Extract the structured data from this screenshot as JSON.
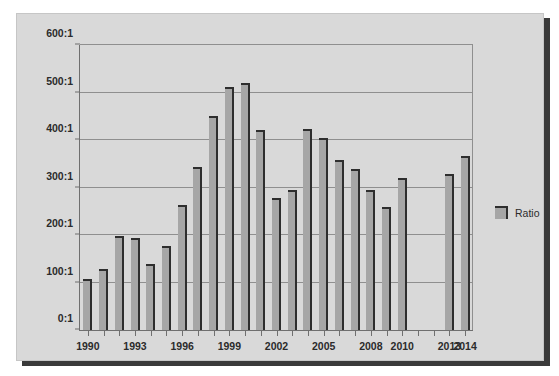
{
  "chart_data": {
    "type": "bar",
    "title": "",
    "xlabel": "",
    "ylabel": "",
    "ylim": [
      0,
      600
    ],
    "ytick_values": [
      0,
      100,
      200,
      300,
      400,
      500,
      600
    ],
    "ytick_labels": [
      "0:1",
      "100:1",
      "200:1",
      "300:1",
      "400:1",
      "500:1",
      "600:1"
    ],
    "grid": true,
    "legend_position": "right",
    "legend": [
      "Ratio"
    ],
    "categories": [
      "1990",
      "1991",
      "1992",
      "1993",
      "1994",
      "1995",
      "1996",
      "1997",
      "1998",
      "1999",
      "2000",
      "2001",
      "2002",
      "2003",
      "2004",
      "2005",
      "2006",
      "2007",
      "2008",
      "2009",
      "2010",
      "2011",
      "2012",
      "2013",
      "2014"
    ],
    "xtick_labels_shown": [
      "1990",
      "1993",
      "1996",
      "1999",
      "2002",
      "2005",
      "2008",
      "2010",
      "2013",
      "2014"
    ],
    "series": [
      {
        "name": "Ratio",
        "values": [
          108,
          128,
          198,
          194,
          139,
          176,
          264,
          343,
          450,
          512,
          521,
          422,
          277,
          294,
          424,
          405,
          358,
          338,
          294,
          259,
          320,
          null,
          null,
          328,
          367
        ]
      }
    ]
  },
  "legend": {
    "items": [
      {
        "label": "Ratio",
        "color": "#a6a6a6"
      }
    ]
  },
  "colors": {
    "bar_fill": "#a6a6a6",
    "bar_edge": "#2e2e2e",
    "panel_background": "#d9d9d9",
    "axis": "#6f6f6f",
    "gridline": "#8f8f8f",
    "text": "#2b2b2b",
    "shadow": "#3a3a3a"
  }
}
